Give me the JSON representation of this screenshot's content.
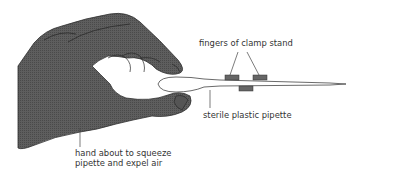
{
  "diagram": {
    "labels": {
      "clamp": "fingers of clamp stand",
      "pipette": "sterile plastic pipette",
      "hand_line1": "hand about to squeeze",
      "hand_line2": "pipette and expel air"
    },
    "colors": {
      "hand_fill": "#5a5a5a",
      "hand_outline": "#2e2e2e",
      "clamp_fill": "#666666",
      "pipette_fill": "#ffffff",
      "pipette_outline": "#444444",
      "leader_line": "#444444",
      "text": "#333333"
    }
  }
}
